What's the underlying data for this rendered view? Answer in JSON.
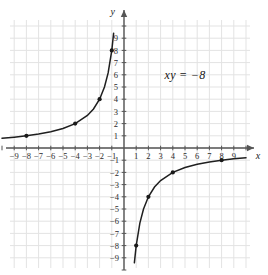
{
  "figure": {
    "name": "hyperbola-graph",
    "equation_label": "xy = −8",
    "background_color": "#ffffff",
    "grid_color": "#e3e3e3",
    "axis_color": "#555555",
    "curve_color": "#1f1f1f",
    "point_color": "#1a1a1a"
  },
  "axes": {
    "x_axis_name": "x",
    "y_axis_name": "y",
    "x_ticks_negative": [
      "−9",
      "−8",
      "−7",
      "−6",
      "−5",
      "−4",
      "−3",
      "−2",
      "−1"
    ],
    "x_ticks_positive": [
      "1",
      "2",
      "3",
      "4",
      "5",
      "6",
      "7",
      "8",
      "9"
    ],
    "y_ticks_positive": [
      "1",
      "2",
      "3",
      "4",
      "5",
      "6",
      "7",
      "8",
      "9"
    ],
    "y_ticks_negative": [
      "−1",
      "−2",
      "−3",
      "−4",
      "−5",
      "−6",
      "−7",
      "−8",
      "−9"
    ]
  },
  "chart_data": {
    "type": "line",
    "title": "",
    "subtitle": "",
    "xlabel": "x",
    "ylabel": "y",
    "xlim": [
      -10.5,
      10.5
    ],
    "ylim": [
      -10.5,
      10.5
    ],
    "grid": true,
    "legend": false,
    "annotations": [
      {
        "text": "xy = −8",
        "x": 5.0,
        "y": 6.0
      }
    ],
    "series": [
      {
        "name": "xy = -8 (second quadrant branch)",
        "equation": "y = -8/x",
        "x": [
          -10.0,
          -9.0,
          -8.0,
          -7.0,
          -6.0,
          -5.0,
          -4.0,
          -3.0,
          -2.5,
          -2.0,
          -1.6,
          -1.3,
          -1.0,
          -0.85
        ],
        "y": [
          0.8,
          0.889,
          1.0,
          1.143,
          1.333,
          1.6,
          2.0,
          2.667,
          3.2,
          4.0,
          5.0,
          6.154,
          8.0,
          9.41
        ],
        "marked_points": [
          {
            "x": -8,
            "y": 1
          },
          {
            "x": -4,
            "y": 2
          },
          {
            "x": -2,
            "y": 4
          },
          {
            "x": -1,
            "y": 8
          }
        ]
      },
      {
        "name": "xy = -8 (fourth quadrant branch)",
        "equation": "y = -8/x",
        "x": [
          0.85,
          1.0,
          1.3,
          1.6,
          2.0,
          2.5,
          3.0,
          4.0,
          5.0,
          6.0,
          7.0,
          8.0,
          9.0,
          10.0
        ],
        "y": [
          -9.41,
          -8.0,
          -6.154,
          -5.0,
          -4.0,
          -3.2,
          -2.667,
          -2.0,
          -1.6,
          -1.333,
          -1.143,
          -1.0,
          -0.889,
          -0.8
        ],
        "marked_points": [
          {
            "x": 1,
            "y": -8
          },
          {
            "x": 2,
            "y": -4
          },
          {
            "x": 4,
            "y": -2
          },
          {
            "x": 8,
            "y": -1
          }
        ]
      }
    ]
  }
}
